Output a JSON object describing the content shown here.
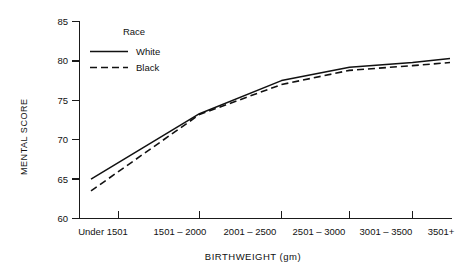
{
  "chart_data": {
    "type": "line",
    "title": "",
    "xlabel": "BIRTHWEIGHT (gm)",
    "ylabel": "MENTAL SCORE",
    "categories": [
      "Under 1501",
      "1501 – 2000",
      "2001 – 2500",
      "2501 – 3000",
      "3001 – 3500",
      "3501+"
    ],
    "ylim": [
      60,
      85
    ],
    "yticks": [
      60,
      65,
      70,
      75,
      80,
      85
    ],
    "ytick_labels": [
      "60",
      "65",
      "70",
      "75",
      "80",
      "85"
    ],
    "grid": false,
    "legend_position": "top-left-inside",
    "legend_title": "Race",
    "series": [
      {
        "name": "White",
        "style": "solid",
        "values": [
          65.0,
          73.3,
          77.5,
          79.2,
          79.8,
          80.3
        ]
      },
      {
        "name": "Black",
        "style": "dashed",
        "values": [
          63.5,
          73.2,
          77.0,
          78.8,
          79.4,
          79.8
        ]
      }
    ]
  },
  "axis": {
    "y_title": "MENTAL SCORE",
    "x_title": "BIRTHWEIGHT (gm)",
    "y_ticks": [
      "85",
      "80",
      "75",
      "70",
      "65",
      "60"
    ],
    "x_ticks": [
      "Under 1501",
      "1501 – 2000",
      "2001 – 2500",
      "2501 – 3000",
      "3001 – 3500",
      "3501+"
    ]
  },
  "legend": {
    "title": "Race",
    "entries": [
      {
        "label": "White",
        "style": "solid"
      },
      {
        "label": "Black",
        "style": "dashed"
      }
    ]
  },
  "colors": {
    "ink": "#111111",
    "background": "#ffffff"
  }
}
